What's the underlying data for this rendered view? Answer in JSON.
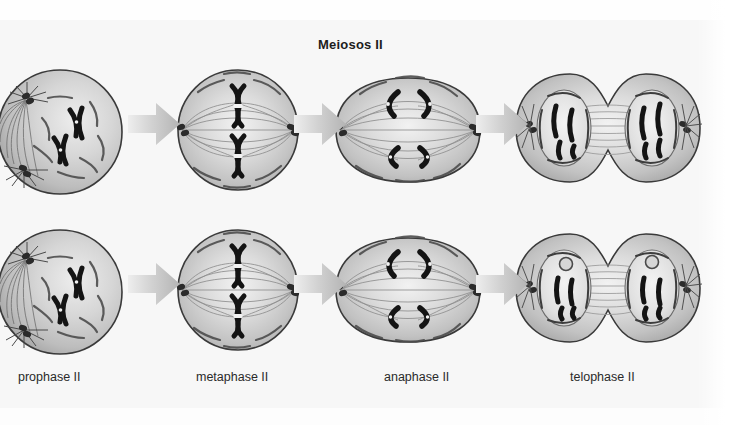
{
  "figure": {
    "title": "Meiosos II",
    "type": "biology-diagram",
    "rows": 2,
    "columns": 4,
    "background_color": "#f7f7f7",
    "cell_fill_color": "#c9c9c9",
    "cell_outline_color": "#3a3a3a",
    "chromosome_color": "#1a1a1a",
    "arrow_color": "#bdbdbd",
    "label_color": "#2a2a2a"
  },
  "stages": [
    {
      "id": "prophase",
      "label": "prophase II",
      "shape": "sphere",
      "description": "spherical cell with condensed X-shaped chromosomes and asters radiating from two centrosomes at the left pole",
      "chromosome_count": 2,
      "chromosome_form": "X-shaped (sister chromatids joined at centromere)"
    },
    {
      "id": "metaphase",
      "label": "metaphase II",
      "shape": "sphere",
      "description": "spherical cell with X-shaped chromosomes aligned on the metaphase plate between centrosomes at opposite poles",
      "chromosome_count": 2,
      "chromosome_form": "X-shaped aligned at equator"
    },
    {
      "id": "anaphase",
      "label": "anaphase II",
      "shape": "elongated-oval",
      "description": "elongated cell with four V-shaped sister chromatids pulled toward opposite poles",
      "chromosome_count": 4,
      "chromosome_form": "V-shaped separated chromatids"
    },
    {
      "id": "telophase",
      "label": "telophase II",
      "shape": "dumbbell",
      "description": "two daughter cells joined at a cleavage furrow, each with a reforming nuclear envelope around decondensing chromatids",
      "chromosome_count": 4,
      "chromosome_form": "rod-shaped chromatids inside reforming nuclei"
    }
  ],
  "arrows": {
    "label": "progression-arrow",
    "direction": "right",
    "count": 6
  }
}
